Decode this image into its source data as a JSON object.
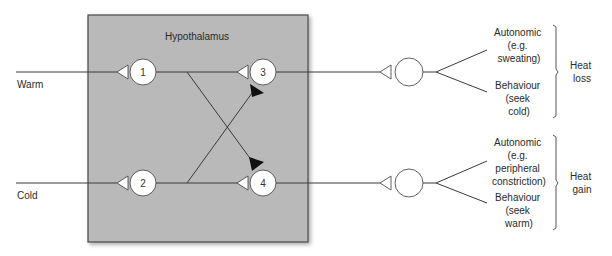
{
  "region": {
    "label": "Hypothalamus",
    "fill": "#b9b9b9",
    "border": "#4a4a4a"
  },
  "inputs": [
    {
      "id": "warm",
      "label": "Warm"
    },
    {
      "id": "cold",
      "label": "Cold"
    }
  ],
  "neurons": [
    {
      "id": "n1",
      "label": "1"
    },
    {
      "id": "n2",
      "label": "2"
    },
    {
      "id": "n3",
      "label": "3"
    },
    {
      "id": "n4",
      "label": "4"
    }
  ],
  "connections": [
    {
      "from": "warm",
      "to": "n1",
      "type": "excitatory"
    },
    {
      "from": "cold",
      "to": "n2",
      "type": "excitatory"
    },
    {
      "from": "n1",
      "to": "n3",
      "type": "excitatory"
    },
    {
      "from": "n1",
      "to": "n4",
      "type": "inhibitory"
    },
    {
      "from": "n2",
      "to": "n4",
      "type": "excitatory"
    },
    {
      "from": "n2",
      "to": "n3",
      "type": "inhibitory"
    }
  ],
  "outputs": [
    {
      "id": "heat-loss",
      "autonomic": [
        "Autonomic",
        "(e.g.",
        "sweating)"
      ],
      "behaviour": [
        "Behaviour",
        "(seek",
        "cold)"
      ],
      "result": [
        "Heat",
        "loss"
      ]
    },
    {
      "id": "heat-gain",
      "autonomic": [
        "Autonomic",
        "(e.g.",
        "peripheral",
        "constriction)"
      ],
      "behaviour": [
        "Behaviour",
        "(seek",
        "warm)"
      ],
      "result": [
        "Heat",
        "gain"
      ]
    }
  ]
}
